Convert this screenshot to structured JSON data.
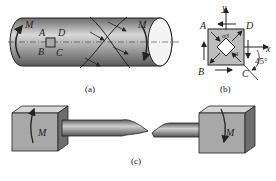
{
  "figure_a": {
    "caption": "(a)",
    "moment_left": "M",
    "moment_right": "M",
    "points": {
      "A": "A",
      "B": "B",
      "C": "C",
      "D": "D"
    }
  },
  "figure_b": {
    "caption": "(b)",
    "axis_y": "y",
    "axis_x": "x",
    "points": {
      "A": "A",
      "B": "B",
      "C": "C",
      "D": "D"
    },
    "sigma3": "σ3",
    "sigma1": "σ1",
    "angle": "45°"
  },
  "figure_c": {
    "caption": "(c)",
    "moment_left": "M",
    "moment_right": "M"
  },
  "colors": {
    "body_gray": "#8a8a8a",
    "light_gray": "#c8c8c8",
    "line": "#222222"
  }
}
